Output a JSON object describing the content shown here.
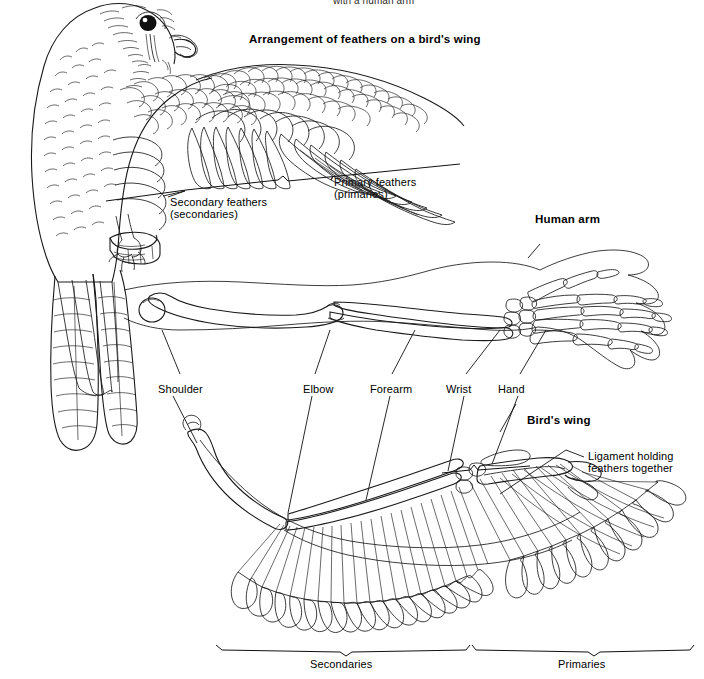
{
  "page": {
    "background": "#ffffff",
    "ink_color": "#1a1a1a",
    "width": 704,
    "height": 679
  },
  "titles": {
    "clipped_top": "with a human arm",
    "feather_arrangement": "Arrangement of feathers on a bird's wing",
    "human_arm": "Human arm",
    "birds_wing": "Bird's wing"
  },
  "feather_labels": {
    "primary": "Primary feathers",
    "primary_alt": "(primaries)",
    "secondary": "Secondary feathers",
    "secondary_alt": "(secondaries)"
  },
  "ligament": {
    "line1": "Ligament holding",
    "line2": "feathers together"
  },
  "bone_labels": [
    {
      "id": "shoulder",
      "text": "Shoulder"
    },
    {
      "id": "elbow",
      "text": "Elbow"
    },
    {
      "id": "forearm",
      "text": "Forearm"
    },
    {
      "id": "wrist",
      "text": "Wrist"
    },
    {
      "id": "hand",
      "text": "Hand"
    }
  ],
  "bottom_braces": [
    {
      "id": "secondaries",
      "text": "Secondaries"
    },
    {
      "id": "primaries",
      "text": "Primaries"
    }
  ],
  "figures": {
    "perched_falcon": "perched-falcon-line-drawing",
    "human_arm_skeleton": "human-arm-skeleton-line-drawing",
    "bird_wing_skeleton": "bird-wing-skeleton-line-drawing"
  }
}
